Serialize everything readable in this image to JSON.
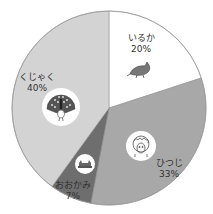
{
  "chart_data": {
    "type": "pie",
    "title": "",
    "start_angle_deg": 0,
    "direction": "clockwise",
    "center": [
      109,
      108
    ],
    "radius": 97,
    "slices": [
      {
        "label": "いるか",
        "value": 20,
        "pct_label": "20%",
        "color": "#ffffff",
        "icon": "dolphin-icon",
        "label_pos": [
          141,
          33
        ],
        "icon_pos": [
          140,
          70
        ],
        "icon_circle": false
      },
      {
        "label": "ひつじ",
        "value": 33,
        "pct_label": "33%",
        "color": "#a8a8a8",
        "icon": "sheep-icon",
        "label_pos": [
          169,
          158
        ],
        "icon_pos": [
          141,
          146
        ],
        "icon_circle": true,
        "icon_r": 15
      },
      {
        "label": "おおかみ",
        "value": 7,
        "pct_label": "7%",
        "color": "#6e6e6e",
        "icon": "wolf-icon",
        "label_pos": [
          73,
          180
        ],
        "icon_pos": [
          85,
          164
        ],
        "icon_circle": true,
        "icon_r": 10
      },
      {
        "label": "くじゃく",
        "value": 40,
        "pct_label": "40%",
        "color": "#d3d3d3",
        "icon": "peacock-icon",
        "label_pos": [
          37,
          72
        ],
        "icon_pos": [
          61,
          107
        ],
        "icon_circle": true,
        "icon_r": 19
      }
    ],
    "legend": null
  }
}
